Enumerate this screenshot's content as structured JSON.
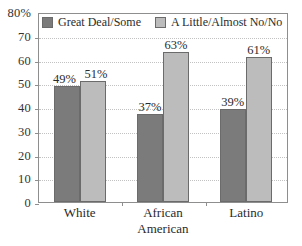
{
  "chart_data": {
    "type": "bar",
    "title": "",
    "subtitle": "",
    "xlabel": "",
    "ylabel": "",
    "ylim": [
      0,
      80
    ],
    "y_unit": "%",
    "grid": true,
    "legend_position": "top-inside",
    "categories": [
      "White",
      "African American",
      "Latino"
    ],
    "category_lines": [
      [
        "White"
      ],
      [
        "African",
        "American"
      ],
      [
        "Latino"
      ]
    ],
    "series": [
      {
        "name": "Great Deal/Some",
        "color": "#7b7b7b",
        "values": [
          49,
          51,
          39
        ],
        "labels": [
          "49%",
          "37%",
          "39%"
        ]
      },
      {
        "name": "A Little/Almost No/No",
        "color": "#bcbcbc",
        "values": [
          51,
          63,
          61
        ],
        "labels": [
          "51%",
          "63%",
          "61%"
        ]
      }
    ],
    "groups": [
      {
        "category": "White",
        "bars": [
          {
            "series": "Great Deal/Some",
            "value": 49,
            "label": "49%"
          },
          {
            "series": "A Little/Almost No/No",
            "value": 51,
            "label": "51%"
          }
        ]
      },
      {
        "category": "African American",
        "bars": [
          {
            "series": "Great Deal/Some",
            "value": 37,
            "label": "37%"
          },
          {
            "series": "A Little/Almost No/No",
            "value": 63,
            "label": "63%"
          }
        ]
      },
      {
        "category": "Latino",
        "bars": [
          {
            "series": "Great Deal/Some",
            "value": 39,
            "label": "39%"
          },
          {
            "series": "A Little/Almost No/No",
            "value": 61,
            "label": "61%"
          }
        ]
      }
    ],
    "y_ticks": [
      {
        "value": 80,
        "label": "80%"
      },
      {
        "value": 70,
        "label": "70"
      },
      {
        "value": 60,
        "label": "60"
      },
      {
        "value": 50,
        "label": "50"
      },
      {
        "value": 40,
        "label": "40"
      },
      {
        "value": 30,
        "label": "30"
      },
      {
        "value": 20,
        "label": "20"
      },
      {
        "value": 10,
        "label": "10"
      },
      {
        "value": 0,
        "label": "0"
      }
    ]
  },
  "legend": {
    "items": [
      {
        "label": "Great Deal/Some",
        "color": "#7b7b7b"
      },
      {
        "label": "A Little/Almost No/No",
        "color": "#bcbcbc"
      }
    ]
  },
  "colors": {
    "series_dark": "#7b7b7b",
    "series_light": "#bcbcbc",
    "frame": "#8e8e8e",
    "gridline": "#c2c2c2",
    "text": "#2b2b2b",
    "background": "#ffffff"
  }
}
